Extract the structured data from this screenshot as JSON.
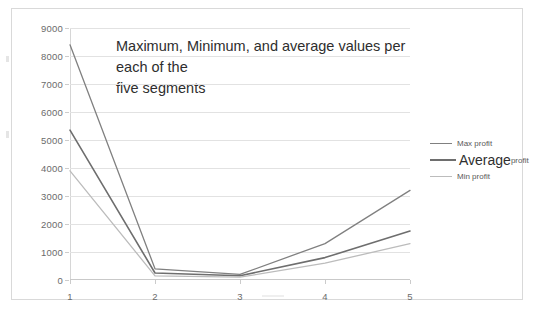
{
  "chart_data": {
    "type": "line",
    "title": "Maximum, Minimum, and average values per each of the five segments",
    "title_line1": "Maximum, Minimum, and average values per each of the",
    "title_line2": "five segments",
    "xlabel": "",
    "ylabel": "",
    "categories": [
      "1",
      "2",
      "3",
      "4",
      "5"
    ],
    "ylim": [
      0,
      9000
    ],
    "ytick_labels": [
      "0",
      "1000",
      "2000",
      "3000",
      "4000",
      "5000",
      "6000",
      "7000",
      "8000",
      "9000"
    ],
    "ytick_values": [
      0,
      1000,
      2000,
      3000,
      4000,
      5000,
      6000,
      7000,
      8000,
      9000
    ],
    "grid": true,
    "legend_position": "right",
    "series": [
      {
        "name": "Max profit",
        "legend_label": "Max profit",
        "color": "#808080",
        "width": 1.3,
        "values": [
          8400,
          400,
          200,
          1300,
          3200
        ]
      },
      {
        "name": "Average profit",
        "legend_label_main": "Average",
        "legend_label_sub": "profit",
        "color": "#6e6e6e",
        "width": 1.6,
        "values": [
          5350,
          250,
          150,
          800,
          1750
        ]
      },
      {
        "name": "Min profit",
        "legend_label": "Min profit",
        "color": "#bcbcbc",
        "width": 1.3,
        "values": [
          3900,
          150,
          100,
          600,
          1300
        ]
      }
    ]
  }
}
